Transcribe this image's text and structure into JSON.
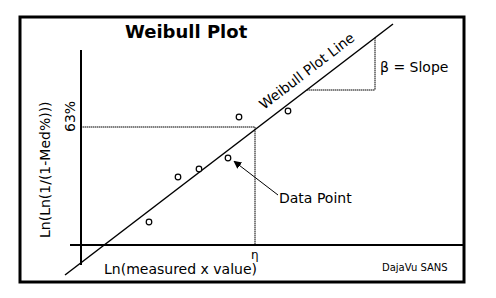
{
  "diagram": {
    "title": "Weibull Plot",
    "y_axis_label": "Ln(Ln(1/(1-Med%)))",
    "x_axis_label": "Ln(measured x value)",
    "y_marker_label": "63%",
    "x_marker_label": "η",
    "line_label": "Weibull Plot Line",
    "slope_label": "β = Slope",
    "data_point_label": "Data Point",
    "footer_note": "DajaVu SANS",
    "colors": {
      "stroke": "#000000",
      "background": "#ffffff"
    },
    "data_points": [
      {
        "x": 149,
        "y": 222
      },
      {
        "x": 178,
        "y": 177
      },
      {
        "x": 199,
        "y": 169
      },
      {
        "x": 228,
        "y": 158
      },
      {
        "x": 239,
        "y": 117
      },
      {
        "x": 288,
        "y": 111
      }
    ]
  }
}
